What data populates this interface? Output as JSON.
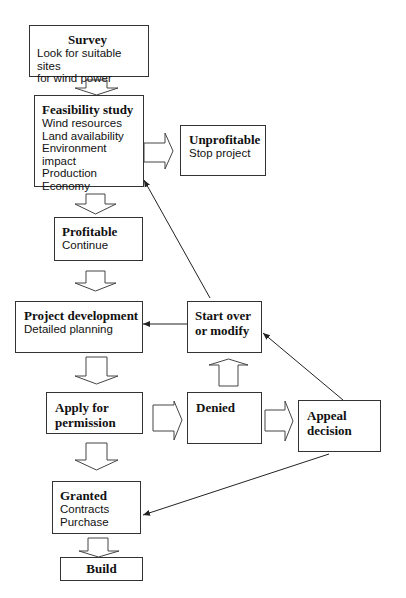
{
  "diagram": {
    "nodes": {
      "survey": {
        "title": "Survey",
        "lines": [
          "Look for suitable sites",
          "for wind power"
        ]
      },
      "feasibility": {
        "title": "Feasibility study",
        "lines": [
          "Wind resources",
          "Land availability",
          "Environment impact",
          "Production",
          "Economy"
        ]
      },
      "unprofitable": {
        "title": "Unprofitable",
        "lines": [
          "Stop project"
        ]
      },
      "profitable": {
        "title": "Profitable",
        "lines": [
          "Continue"
        ]
      },
      "development": {
        "title": "Project development",
        "lines": [
          "Detailed planning"
        ]
      },
      "startover": {
        "title_lines": [
          "Start over",
          "or modify"
        ]
      },
      "apply": {
        "title_lines": [
          "Apply for",
          "permission"
        ]
      },
      "denied": {
        "title": "Denied"
      },
      "appeal": {
        "title_lines": [
          "Appeal",
          "decision"
        ]
      },
      "granted": {
        "title": "Granted",
        "lines": [
          "Contracts",
          "Purchase"
        ]
      },
      "build": {
        "title": "Build"
      }
    },
    "edges": [
      {
        "from": "survey",
        "to": "feasibility",
        "style": "block-arrow"
      },
      {
        "from": "feasibility",
        "to": "unprofitable",
        "style": "block-arrow"
      },
      {
        "from": "feasibility",
        "to": "profitable",
        "style": "block-arrow"
      },
      {
        "from": "profitable",
        "to": "development",
        "style": "block-arrow"
      },
      {
        "from": "development",
        "to": "apply",
        "style": "block-arrow"
      },
      {
        "from": "apply",
        "to": "denied",
        "style": "block-arrow"
      },
      {
        "from": "apply",
        "to": "granted",
        "style": "block-arrow"
      },
      {
        "from": "denied",
        "to": "startover",
        "style": "block-arrow"
      },
      {
        "from": "denied",
        "to": "appeal",
        "style": "block-arrow"
      },
      {
        "from": "granted",
        "to": "build",
        "style": "block-arrow"
      },
      {
        "from": "startover",
        "to": "development",
        "style": "line-arrow"
      },
      {
        "from": "startover",
        "to": "feasibility",
        "style": "line-arrow"
      },
      {
        "from": "appeal",
        "to": "startover",
        "style": "line-arrow"
      },
      {
        "from": "appeal",
        "to": "granted",
        "style": "line-arrow"
      }
    ],
    "colors": {
      "stroke": "#333333",
      "background": "#ffffff",
      "text": "#111111"
    }
  }
}
